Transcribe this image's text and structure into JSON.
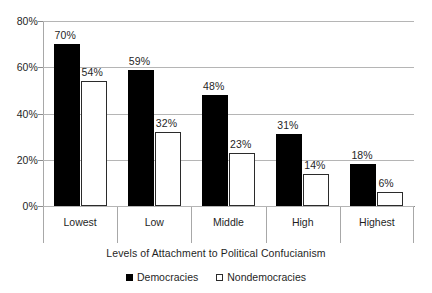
{
  "chart_data": {
    "type": "bar",
    "title": "",
    "xlabel": "Levels of Attachment to Political Confucianism",
    "ylabel": "",
    "categories": [
      "Lowest",
      "Low",
      "Middle",
      "High",
      "Highest"
    ],
    "series": [
      {
        "name": "Democracies",
        "color": "#000000",
        "values": [
          70,
          59,
          48,
          31,
          18
        ],
        "labels": [
          "70%",
          "59%",
          "48%",
          "31%",
          "18%"
        ]
      },
      {
        "name": "Nondemocracies",
        "color": "#ffffff",
        "values": [
          54,
          32,
          23,
          14,
          6
        ],
        "labels": [
          "54%",
          "32%",
          "23%",
          "14%",
          "6%"
        ]
      }
    ],
    "ylim": [
      0,
      80
    ],
    "yticks": [
      0,
      20,
      40,
      60,
      80
    ],
    "ytick_labels": [
      "0%",
      "20%",
      "40%",
      "60%",
      "80%"
    ],
    "grid": true,
    "legend_position": "bottom"
  },
  "legend": {
    "items": [
      {
        "label": "Democracies"
      },
      {
        "label": "Nondemocracies"
      }
    ]
  }
}
